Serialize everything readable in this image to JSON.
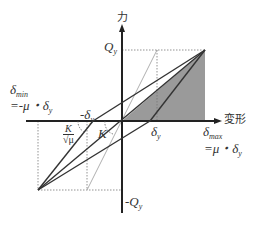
{
  "diagram": {
    "type": "hysteresis-loop",
    "axes": {
      "y_label": "力",
      "x_label": "変形"
    },
    "labels": {
      "qy": "Q",
      "qy_sub": "y",
      "neg_qy": "-Q",
      "neg_qy_sub": "y",
      "delta_y": "δ",
      "delta_y_sub": "y",
      "neg_delta_y": "-δ",
      "neg_delta_y_sub": "y",
      "delta_max": "δ",
      "delta_max_sub": "max",
      "delta_max_eq": "=μ・δ",
      "delta_max_eq_sub": "y",
      "delta_min": "δ",
      "delta_min_sub": "min",
      "delta_min_eq": "=-μ・δ",
      "delta_min_eq_sub": "y",
      "k": "K",
      "k_reduced_num": "K",
      "k_reduced_den": "√μ"
    },
    "colors": {
      "line": "#333333",
      "shade": "#9a9a9a",
      "dotted": "#777777"
    }
  }
}
